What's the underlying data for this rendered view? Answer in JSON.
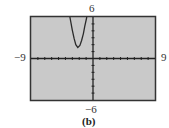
{
  "chart_data": {
    "type": "line",
    "title": "",
    "caption": "(b)",
    "xlabel": "",
    "ylabel": "",
    "xlim": [
      -9,
      9
    ],
    "ylim": [
      -6,
      6
    ],
    "x_tick_step": 1,
    "y_tick_step": 1,
    "grid": false,
    "legend": null,
    "window_labels": {
      "xmin": "−9",
      "xmax": "9",
      "ymin": "−6",
      "ymax": "6"
    },
    "series": [
      {
        "name": "parabola",
        "x": [
          -3.35,
          -3.0,
          -2.75,
          -2.5,
          -2.2,
          -1.9,
          -1.65,
          -1.4,
          -1.2,
          -0.9
        ],
        "y": [
          6.0,
          4.1,
          2.9,
          2.0,
          1.6,
          1.9,
          2.6,
          3.6,
          4.6,
          6.0
        ]
      }
    ],
    "colors": {
      "screen_bg": "#c8c8c8",
      "frame": "#333333",
      "curve": "#2a2a2a",
      "axes": "#222222"
    }
  }
}
